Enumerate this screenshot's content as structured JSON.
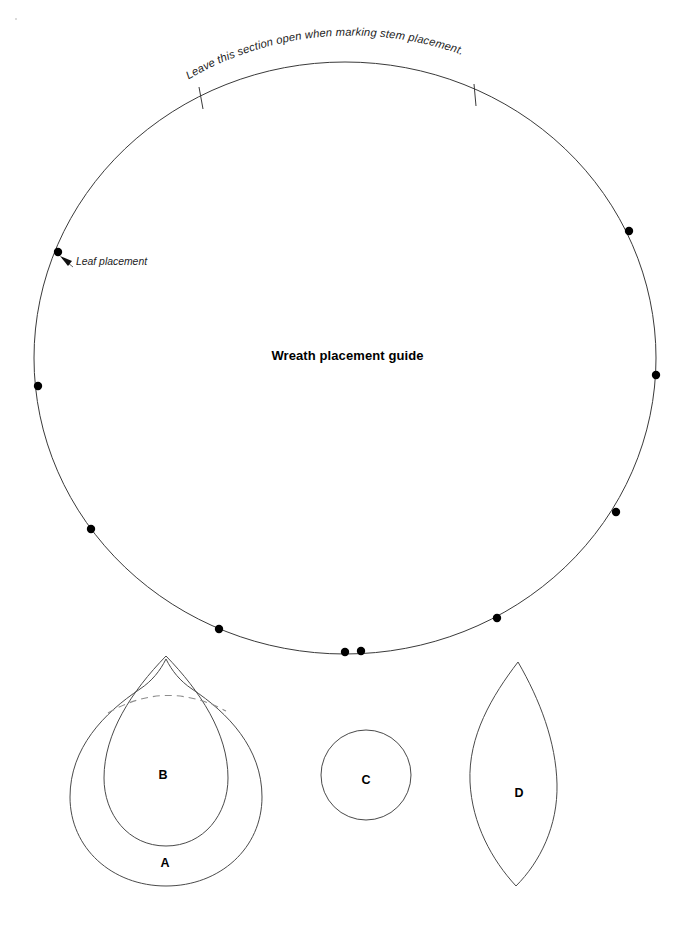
{
  "page": {
    "title": "Wreath placement guide",
    "background_color": "#ffffff",
    "width": 695,
    "height": 925
  },
  "guide_circle": {
    "name": "wreath-placement-circle",
    "center_x": 345,
    "center_y": 358,
    "radius_x": 311,
    "radius_y": 296,
    "stroke_color": "#3a3a3a"
  },
  "annotations": {
    "arc_note": "Leave this section open when marking stem placement.",
    "leaf_note": "Leaf placement",
    "center_title": "Wreath placement guide"
  },
  "open_section_ticks": [
    {
      "name": "tick-left",
      "x1": 199,
      "y1": 87,
      "x2": 203,
      "y2": 108
    },
    {
      "name": "tick-right",
      "x1": 474,
      "y1": 84,
      "x2": 476,
      "y2": 105
    }
  ],
  "placement_dots": [
    {
      "id": "dot-1",
      "cx": 58,
      "cy": 252,
      "r": 4.2
    },
    {
      "id": "dot-2",
      "cx": 38,
      "cy": 386,
      "r": 4.2
    },
    {
      "id": "dot-3",
      "cx": 91,
      "cy": 529,
      "r": 4.2
    },
    {
      "id": "dot-4",
      "cx": 219,
      "cy": 629,
      "r": 4.2
    },
    {
      "id": "dot-5",
      "cx": 345,
      "cy": 652,
      "r": 4.2
    },
    {
      "id": "dot-6",
      "cx": 361,
      "cy": 651,
      "r": 4.2
    },
    {
      "id": "dot-7",
      "cx": 497,
      "cy": 618,
      "r": 4.2
    },
    {
      "id": "dot-8",
      "cx": 616,
      "cy": 512,
      "r": 4.2
    },
    {
      "id": "dot-9",
      "cx": 656,
      "cy": 375,
      "r": 4.2
    },
    {
      "id": "dot-10",
      "cx": 629,
      "cy": 231,
      "r": 4.2
    }
  ],
  "template_shapes": [
    {
      "id": "shape-a",
      "label": "A",
      "type": "teardrop-outer",
      "label_x": 165,
      "label_y": 867
    },
    {
      "id": "shape-b",
      "label": "B",
      "type": "teardrop-inner",
      "label_x": 163,
      "label_y": 779
    },
    {
      "id": "shape-c",
      "label": "C",
      "type": "circle",
      "label_x": 366,
      "label_y": 784,
      "center_x": 366,
      "center_y": 775,
      "radius": 45
    },
    {
      "id": "shape-d",
      "label": "D",
      "type": "leaf",
      "label_x": 519,
      "label_y": 797
    }
  ],
  "dashed_guide": {
    "name": "shape-overlap-dashed-arc",
    "stroke_color": "#8d8d8d",
    "dash_pattern": "7 5"
  },
  "colors": {
    "line": "#3a3a3a",
    "shape_line": "#4a4a4a",
    "dashed": "#8d8d8d",
    "dot": "#000000",
    "text": "#1c1c1c"
  }
}
